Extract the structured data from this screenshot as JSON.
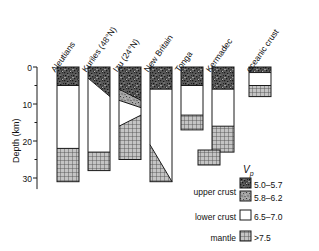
{
  "chart_data": {
    "type": "bar",
    "title": "",
    "subtitle": "",
    "xlabel": "",
    "ylabel": "Depth (km)",
    "ylim": [
      0,
      33
    ],
    "y_ticks_major": [
      0,
      10,
      20,
      30
    ],
    "y_ticks_minor": [
      5,
      15,
      25
    ],
    "y_axis_inverted": true,
    "grid": false,
    "legend_position": "bottom-right",
    "units": {
      "depth": "km",
      "velocity": "km/s"
    },
    "categories": [
      "Aleutians",
      "Kuriles (48°N)",
      "Izu (24°N)",
      "New Britain",
      "Tonga",
      "Kermadec",
      "oceanic crust"
    ],
    "layer_types": [
      {
        "key": "upper_a",
        "label": "upper crust",
        "vp": "5.0–5.7",
        "pattern": "dense-speckle"
      },
      {
        "key": "upper_b",
        "label": "upper crust",
        "vp": "5.8–6.2",
        "pattern": "fine-speckle"
      },
      {
        "key": "lower",
        "label": "lower crust",
        "vp": "6.5–7.0",
        "pattern": "white"
      },
      {
        "key": "mantle",
        "label": "mantle",
        "vp": ">7.5",
        "pattern": "grid"
      }
    ],
    "columns": [
      {
        "name": "Aleutians",
        "total_depth_km": 31,
        "layers": [
          {
            "type": "upper_a",
            "top_km": 0,
            "bottom_km": 5,
            "top_right_km": 0,
            "bottom_right_km": 5
          },
          {
            "type": "lower",
            "top_km": 5,
            "bottom_km": 22,
            "top_right_km": 5,
            "bottom_right_km": 22
          },
          {
            "type": "mantle",
            "top_km": 22,
            "bottom_km": 31,
            "top_right_km": 22,
            "bottom_right_km": 31
          }
        ]
      },
      {
        "name": "Kuriles (48°N)",
        "total_depth_km": 28,
        "layers": [
          {
            "type": "upper_a",
            "top_km": 0,
            "bottom_km": 3,
            "top_right_km": 0,
            "bottom_right_km": 8
          },
          {
            "type": "lower",
            "top_km": 3,
            "bottom_km": 23,
            "top_right_km": 8,
            "bottom_right_km": 23
          },
          {
            "type": "mantle",
            "top_km": 23,
            "bottom_km": 28,
            "top_right_km": 23,
            "bottom_right_km": 28
          }
        ]
      },
      {
        "name": "Izu (24°N)",
        "total_depth_km": 25,
        "layers": [
          {
            "type": "upper_a",
            "top_km": 0,
            "bottom_km": 6,
            "top_right_km": 0,
            "bottom_right_km": 9
          },
          {
            "type": "upper_b",
            "top_km": 6,
            "bottom_km": 9,
            "top_right_km": 9,
            "bottom_right_km": 11
          },
          {
            "type": "lower",
            "top_km": 9,
            "bottom_km": 16,
            "top_right_km": 11,
            "bottom_right_km": 13
          },
          {
            "type": "mantle",
            "top_km": 16,
            "bottom_km": 25,
            "top_right_km": 13,
            "bottom_right_km": 25
          }
        ]
      },
      {
        "name": "New Britain",
        "total_depth_km": 31,
        "layers": [
          {
            "type": "upper_a",
            "top_km": 0,
            "bottom_km": 6,
            "top_right_km": 0,
            "bottom_right_km": 6
          },
          {
            "type": "lower",
            "top_km": 6,
            "bottom_km": 21,
            "top_right_km": 6,
            "bottom_right_km": 31
          },
          {
            "type": "mantle",
            "top_km": 21,
            "bottom_km": 31,
            "top_right_km": 31,
            "bottom_right_km": 31
          }
        ]
      },
      {
        "name": "Tonga",
        "total_depth_km": 17,
        "layers": [
          {
            "type": "upper_a",
            "top_km": 0,
            "bottom_km": 5,
            "top_right_km": 0,
            "bottom_right_km": 5
          },
          {
            "type": "lower",
            "top_km": 5,
            "bottom_km": 13,
            "top_right_km": 5,
            "bottom_right_km": 13
          },
          {
            "type": "mantle",
            "top_km": 13,
            "bottom_km": 17,
            "top_right_km": 13,
            "bottom_right_km": 17
          }
        ]
      },
      {
        "name": "Kermadec",
        "total_depth_km": 23,
        "layers": [
          {
            "type": "upper_a",
            "top_km": 0,
            "bottom_km": 6,
            "top_right_km": 0,
            "bottom_right_km": 6
          },
          {
            "type": "lower",
            "top_km": 6,
            "bottom_km": 16,
            "top_right_km": 6,
            "bottom_right_km": 16
          },
          {
            "type": "mantle",
            "top_km": 16,
            "bottom_km": 23,
            "top_right_km": 16,
            "bottom_right_km": 23
          }
        ]
      },
      {
        "name": "oceanic crust",
        "total_depth_km": 8,
        "layers": [
          {
            "type": "upper_a",
            "top_km": 0,
            "bottom_km": 1.5,
            "top_right_km": 0,
            "bottom_right_km": 1.5
          },
          {
            "type": "lower",
            "top_km": 1.5,
            "bottom_km": 5,
            "top_right_km": 1.5,
            "bottom_right_km": 5
          },
          {
            "type": "mantle",
            "top_km": 5,
            "bottom_km": 8,
            "top_right_km": 5,
            "bottom_right_km": 8
          }
        ]
      }
    ]
  },
  "axis": {
    "ylabel": "Depth (km)",
    "tick_labels": [
      "0",
      "10",
      "20",
      "30"
    ]
  },
  "legend": {
    "vp_title": "V",
    "vp_sub": "p",
    "rows": [
      {
        "label": "upper crust",
        "value": "5.0–5.7",
        "pattern": "dense-speckle"
      },
      {
        "label": "",
        "value": "5.8–6.2",
        "pattern": "fine-speckle"
      },
      {
        "label": "lower crust",
        "value": "6.5–7.0",
        "pattern": "white"
      },
      {
        "label": "mantle",
        "value": ">7.5",
        "pattern": "grid"
      }
    ]
  },
  "colors": {
    "ink": "#1a1a1a",
    "background": "#ffffff",
    "dense_speckle_base": "#6e6e6e",
    "fine_speckle_base": "#8c8c8c",
    "grid_base": "#b5b5b5",
    "white_fill": "#ffffff"
  }
}
